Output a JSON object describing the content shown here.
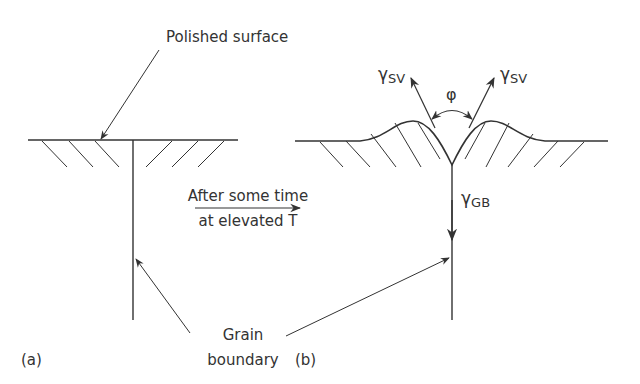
{
  "figure": {
    "panel_a": {
      "label": "(a)",
      "surface_label": "Polished surface"
    },
    "transition": {
      "line1": "After some time",
      "line2": "at elevated T"
    },
    "panel_b": {
      "label": "(b)",
      "gamma_sv_left": "γ",
      "gamma_sv_left_sub": "SV",
      "gamma_sv_right": "γ",
      "gamma_sv_right_sub": "SV",
      "angle": "φ",
      "gamma_gb": "γ",
      "gamma_gb_sub": "GB"
    },
    "shared": {
      "grain_label_line1": "Grain",
      "grain_label_line2": "boundary"
    },
    "colors": {
      "line": "#333333",
      "text": "#333333",
      "background": "#ffffff"
    }
  }
}
